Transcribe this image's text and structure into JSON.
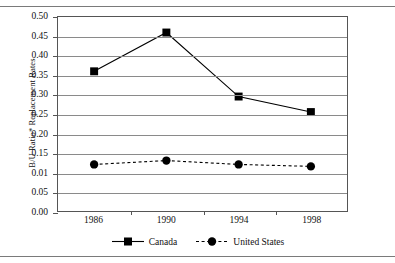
{
  "chart_data": {
    "type": "line",
    "title": "",
    "xlabel": "",
    "ylabel": "B/U Ratio* Replacement Rates",
    "categories": [
      "1986",
      "1990",
      "1994",
      "1998"
    ],
    "ylim": [
      0.0,
      0.5
    ],
    "ytick_labels": [
      "0.50",
      "0.45",
      "0.40",
      "0.35",
      "0.30",
      "0.25",
      "0.20",
      "0.15",
      "0.01",
      "0.05",
      "0.00"
    ],
    "ytick_values": [
      0.5,
      0.45,
      0.4,
      0.35,
      0.3,
      0.25,
      0.2,
      0.15,
      0.1,
      0.05,
      0.0
    ],
    "grid": true,
    "legend_position": "bottom",
    "series": [
      {
        "name": "Canada",
        "values": [
          0.36,
          0.46,
          0.295,
          0.255
        ],
        "marker": "square",
        "linestyle": "solid",
        "color": "#000000"
      },
      {
        "name": "United States",
        "values": [
          0.12,
          0.13,
          0.12,
          0.115
        ],
        "marker": "circle",
        "linestyle": "dashed",
        "color": "#000000"
      }
    ]
  },
  "legend": {
    "entries": [
      {
        "label": "Canada",
        "marker": "square-marker-icon",
        "line": "solid"
      },
      {
        "label": "United States",
        "marker": "circle-marker-icon",
        "line": "dashed"
      }
    ]
  },
  "axes": {
    "y_title": "B/U Ratio* Replacement Rates"
  }
}
